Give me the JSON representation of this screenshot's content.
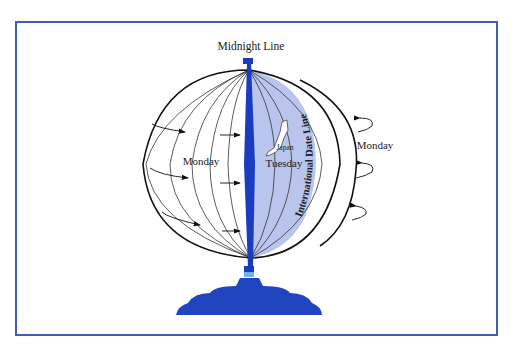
{
  "diagram": {
    "title": "Midnight Line",
    "left_hemisphere_label": "Monday",
    "shaded_region_label": "Tuesday",
    "country_label": "Japan",
    "date_line_label": "International Date Line",
    "right_label": "Monday"
  },
  "colors": {
    "frame_border": "#3f5fb0",
    "midnight_line": "#1a3cc0",
    "shaded_region": "#b9c5ec",
    "pedestal": "#1f45c0",
    "outline": "#111111",
    "meridian": "#333333"
  },
  "icons": {
    "rotation_arrows_left": 4,
    "rotation_arrows_inner": 3,
    "rotation_arrows_right": 3
  }
}
